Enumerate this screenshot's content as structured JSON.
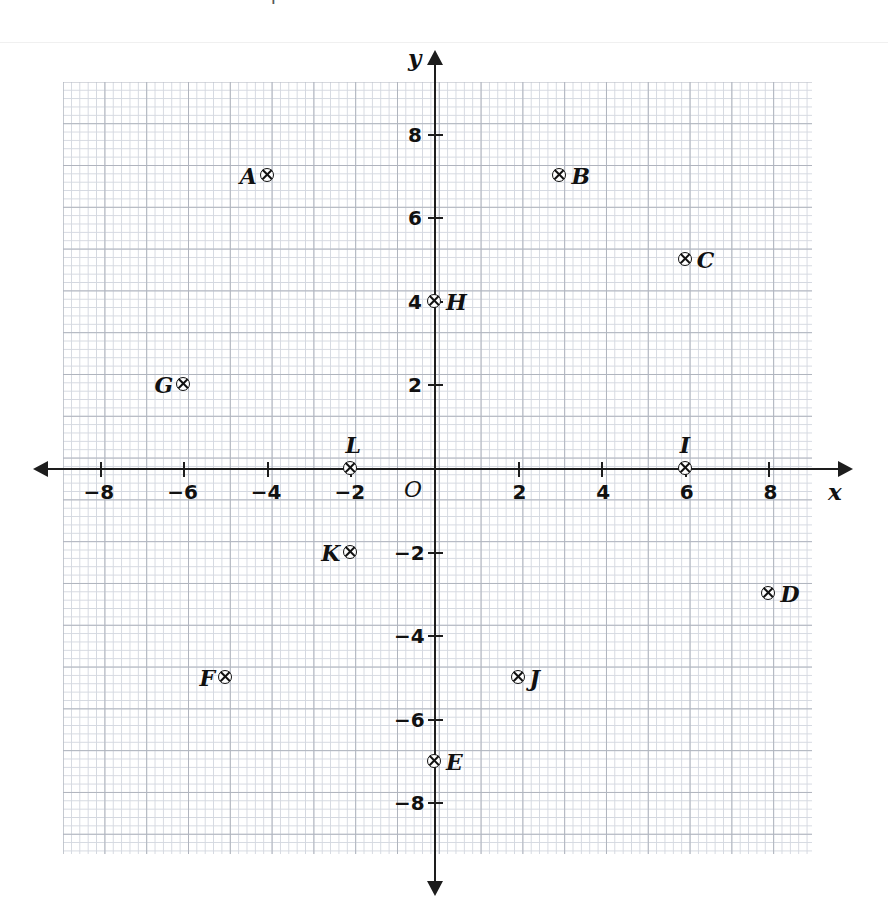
{
  "figure": {
    "kind": "coordinate-plane",
    "origin_label": "O",
    "x_axis_label": "x",
    "y_axis_label": "y"
  },
  "artifact": {
    "partial_glyph": "P"
  },
  "chart_data": {
    "type": "scatter",
    "title": "",
    "xlabel": "x",
    "ylabel": "y",
    "xlim": [
      -9,
      9
    ],
    "ylim": [
      -9,
      9
    ],
    "grid": true,
    "grid_minor_step": 0.2,
    "grid_major_step": 1,
    "legend": "none",
    "x_ticks": [
      -8,
      -6,
      -4,
      -2,
      2,
      4,
      6,
      8
    ],
    "x_tick_labels": [
      "−8",
      "−6",
      "−4",
      "−2",
      "2",
      "4",
      "6",
      "8"
    ],
    "y_ticks": [
      8,
      6,
      4,
      2,
      -2,
      -4,
      -6,
      -8
    ],
    "y_tick_labels": [
      "8",
      "6",
      "4",
      "2",
      "−2",
      "−4",
      "−6",
      "−8"
    ],
    "origin_label": "O",
    "point_marker": "circle-with-x",
    "points": [
      {
        "label": "A",
        "x": -4,
        "y": 7,
        "label_side": "left"
      },
      {
        "label": "B",
        "x": 3,
        "y": 7,
        "label_side": "right"
      },
      {
        "label": "C",
        "x": 6,
        "y": 5,
        "label_side": "right"
      },
      {
        "label": "D",
        "x": 8,
        "y": -3,
        "label_side": "right"
      },
      {
        "label": "E",
        "x": 0,
        "y": -7,
        "label_side": "right"
      },
      {
        "label": "F",
        "x": -5,
        "y": -5,
        "label_side": "left"
      },
      {
        "label": "G",
        "x": -6,
        "y": 2,
        "label_side": "left"
      },
      {
        "label": "H",
        "x": 0,
        "y": 4,
        "label_side": "right"
      },
      {
        "label": "I",
        "x": 6,
        "y": 0,
        "label_side": "above"
      },
      {
        "label": "J",
        "x": 2,
        "y": -5,
        "label_side": "right"
      },
      {
        "label": "K",
        "x": -2,
        "y": -2,
        "label_side": "left"
      },
      {
        "label": "L",
        "x": -2,
        "y": 0,
        "label_side": "above"
      }
    ]
  },
  "geometry": {
    "origin_px": {
      "x": 435,
      "y": 469
    },
    "unit_px": 41.8
  }
}
